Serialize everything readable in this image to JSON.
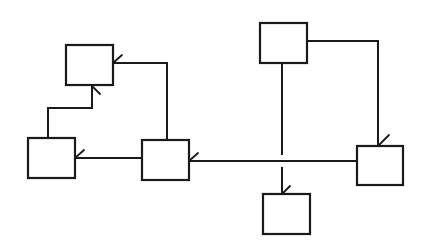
{
  "diagram": {
    "type": "block-connection-diagram",
    "line_color": "#1a1a1a",
    "background": "#ffffff",
    "nodes": [
      {
        "id": "top-left",
        "x": 66,
        "y": 45,
        "w": 47,
        "h": 40,
        "label": ""
      },
      {
        "id": "left",
        "x": 28,
        "y": 138,
        "w": 47,
        "h": 40,
        "label": ""
      },
      {
        "id": "center",
        "x": 142,
        "y": 140,
        "w": 47,
        "h": 40,
        "label": ""
      },
      {
        "id": "top-right",
        "x": 260,
        "y": 23,
        "w": 47,
        "h": 40,
        "label": ""
      },
      {
        "id": "right",
        "x": 357,
        "y": 146,
        "w": 46,
        "h": 39,
        "label": ""
      },
      {
        "id": "bottom",
        "x": 263,
        "y": 194,
        "w": 47,
        "h": 40,
        "label": ""
      }
    ],
    "edges": [
      {
        "from": "center",
        "to": "top-left",
        "desc": "center top up to y63, left into top-left right side"
      },
      {
        "from": "left",
        "to": "top-left",
        "desc": "left top up, right, up into top-left bottom"
      },
      {
        "from": "center",
        "to": "left",
        "desc": "horizontal into left box right side"
      },
      {
        "from": "top-right",
        "to": "right",
        "desc": "right side across then down into right box top"
      },
      {
        "from": "right",
        "to": "center",
        "desc": "horizontal line from right box into center right side"
      },
      {
        "from": "top-right",
        "to": "bottom",
        "desc": "vertical line crossing horizontal bus with gap into bottom box"
      }
    ],
    "arrow_style": "half-arrowhead tick",
    "crossing": {
      "x": 282,
      "y": 161,
      "style": "gap"
    }
  }
}
